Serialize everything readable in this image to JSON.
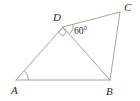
{
  "figure": {
    "name": "quadrilateral-with-diagonal",
    "background_color": "#ffffff",
    "line_color": "#9a9a9a",
    "label_color": "#2b2b2b",
    "width": 140,
    "height": 101
  },
  "vertices": [
    {
      "id": "A",
      "label": "A",
      "x": 16,
      "y": 80,
      "label_x": 11,
      "label_y": 94
    },
    {
      "id": "B",
      "label": "B",
      "x": 110,
      "y": 80,
      "label_x": 106,
      "label_y": 95
    },
    {
      "id": "C",
      "label": "C",
      "x": 120,
      "y": 12,
      "label_x": 124,
      "label_y": 11
    },
    {
      "id": "D",
      "label": "D",
      "x": 63,
      "y": 27,
      "label_x": 53,
      "label_y": 21
    }
  ],
  "edges": [
    {
      "id": "AB",
      "from": "A",
      "to": "B",
      "name": "segment-ab"
    },
    {
      "id": "AD",
      "from": "A",
      "to": "D",
      "name": "segment-ad"
    },
    {
      "id": "DC",
      "from": "D",
      "to": "C",
      "name": "segment-dc"
    },
    {
      "id": "DB",
      "from": "D",
      "to": "B",
      "name": "segment-db"
    },
    {
      "id": "BC",
      "from": "B",
      "to": "C",
      "name": "segment-bc"
    }
  ],
  "angle_marks": [
    {
      "id": "angle-D-right",
      "at": "D",
      "type": "right-angle",
      "measure": "90",
      "label": "",
      "name": "right-angle-mark-d"
    },
    {
      "id": "angle-D-60",
      "at": "D",
      "type": "arc",
      "measure": "60",
      "label": "60°",
      "label_x": 74,
      "label_y": 34,
      "name": "angle-label-60"
    },
    {
      "id": "angle-A",
      "at": "A",
      "type": "arc",
      "measure": "",
      "label": "",
      "name": "angle-arc-a"
    }
  ]
}
